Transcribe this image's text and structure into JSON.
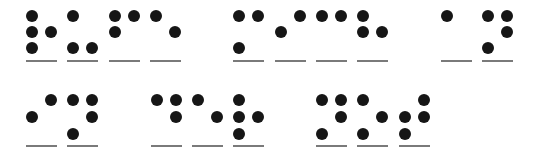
{
  "braille": {
    "language": "de",
    "lines": [
      {
        "text": "rufe mich an",
        "cells": [
          {
            "char": "r",
            "dots": [
              1,
              2,
              3,
              5
            ],
            "x": 32
          },
          {
            "char": "u",
            "dots": [
              1,
              3,
              6
            ],
            "x": 73
          },
          {
            "char": "f",
            "dots": [
              1,
              2,
              4
            ],
            "x": 115
          },
          {
            "char": "e",
            "dots": [
              1,
              5
            ],
            "x": 156
          },
          {
            "char": "m",
            "dots": [
              1,
              3,
              4
            ],
            "x": 239
          },
          {
            "char": "i",
            "dots": [
              2,
              4
            ],
            "x": 281
          },
          {
            "char": "c",
            "dots": [
              1,
              4
            ],
            "x": 322
          },
          {
            "char": "h",
            "dots": [
              1,
              2,
              5
            ],
            "x": 363
          },
          {
            "char": "a",
            "dots": [
              1
            ],
            "x": 447
          },
          {
            "char": "n",
            "dots": [
              1,
              3,
              4,
              5
            ],
            "x": 488
          }
        ]
      },
      {
        "text": "in der not",
        "cells": [
          {
            "char": "i",
            "dots": [
              2,
              4
            ],
            "x": 32
          },
          {
            "char": "n",
            "dots": [
              1,
              3,
              4,
              5
            ],
            "x": 73
          },
          {
            "char": "d",
            "dots": [
              1,
              4,
              5
            ],
            "x": 157
          },
          {
            "char": "e",
            "dots": [
              1,
              5
            ],
            "x": 198
          },
          {
            "char": "r",
            "dots": [
              1,
              2,
              3,
              5
            ],
            "x": 239
          },
          {
            "char": "n",
            "dots": [
              1,
              3,
              4,
              5
            ],
            "x": 322
          },
          {
            "char": "o",
            "dots": [
              1,
              3,
              5
            ],
            "x": 363
          },
          {
            "char": "t",
            "dots": [
              2,
              3,
              4,
              5
            ],
            "x": 405
          }
        ]
      }
    ]
  },
  "layout": {
    "line_dot_rows_y": [
      [
        16,
        32,
        48
      ],
      [
        100,
        117,
        134
      ]
    ],
    "underline_y": [
      61,
      146
    ],
    "col_gap": 19
  },
  "colors": {
    "dot": "#161616",
    "underline": "#7a7a7a",
    "background": "#ffffff"
  }
}
